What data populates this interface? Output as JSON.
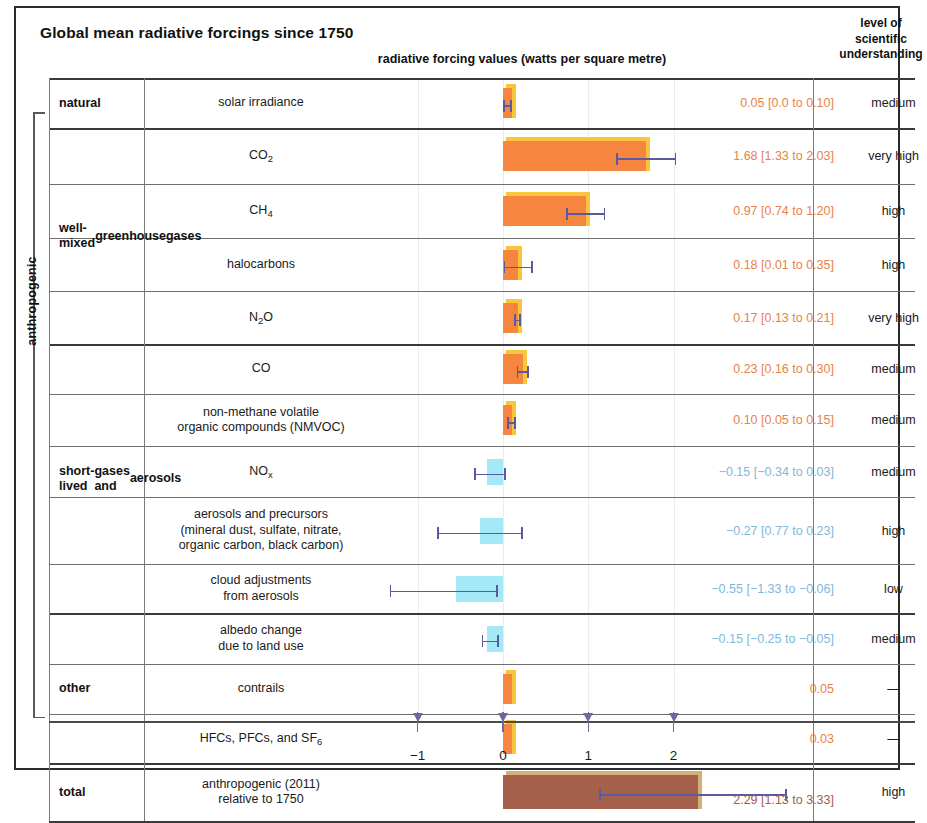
{
  "header": {
    "title": "Global mean radiative forcings since 1750",
    "chart_axis_title": "radiative forcing values (watts per square metre)",
    "lsu_col_line1": "level of",
    "lsu_col_line2": "scientific",
    "lsu_col_line3": "understanding"
  },
  "side_bracket": {
    "label": "anthropogenic"
  },
  "groups": [
    {
      "label": "natural"
    },
    {
      "label": "well-mixed\ngreenhouse\ngases"
    },
    {
      "label": "short-lived\ngases and\naerosols"
    },
    {
      "label": "other"
    },
    {
      "label": "total"
    }
  ],
  "colors": {
    "positive_bar": "#f5853f",
    "positive_bar_top": "#f9c53c",
    "negative_bar": "#a5e9f7",
    "total_bar": "#a4604a",
    "total_bar_top": "#d2b077",
    "error_bar": "#5a5aa0",
    "positive_text": "#e8824a",
    "negative_text": "#80b9da",
    "total_text": "#a4604a",
    "grid": "#ececec",
    "rule": "#6f6f6f"
  },
  "chart_data": {
    "type": "bar",
    "title": "Global mean radiative forcings since 1750",
    "xlabel": "radiative forcing values (watts per square metre)",
    "ylabel": "",
    "xlim": [
      -1.55,
      2.85
    ],
    "xticks": [
      -1,
      0,
      1,
      2
    ],
    "xticklabels": [
      "−1",
      "0",
      "1",
      "2"
    ],
    "grid": true,
    "orientation": "horizontal",
    "rows": [
      {
        "group": "natural",
        "label": "solar irradiance",
        "label_html": "solar irradiance",
        "value": 0.05,
        "low": 0.0,
        "high": 0.1,
        "value_text": "0.05 [0.0 to 0.10]",
        "lsu": "medium",
        "sign": "positive"
      },
      {
        "group": "well-mixed greenhouse gases",
        "label": "CO2",
        "label_html": "CO<sub>2</sub>",
        "value": 1.68,
        "low": 1.33,
        "high": 2.03,
        "value_text": "1.68 [1.33 to 2.03]",
        "lsu": "very high",
        "sign": "positive"
      },
      {
        "group": "well-mixed greenhouse gases",
        "label": "CH4",
        "label_html": "CH<sub>4</sub>",
        "value": 0.97,
        "low": 0.74,
        "high": 1.2,
        "value_text": "0.97 [0.74 to 1.20]",
        "lsu": "high",
        "sign": "positive"
      },
      {
        "group": "well-mixed greenhouse gases",
        "label": "halocarbons",
        "label_html": "halocarbons",
        "value": 0.18,
        "low": 0.01,
        "high": 0.35,
        "value_text": "0.18 [0.01 to 0.35]",
        "lsu": "high",
        "sign": "positive"
      },
      {
        "group": "well-mixed greenhouse gases",
        "label": "N2O",
        "label_html": "N<sub>2</sub>O",
        "value": 0.17,
        "low": 0.13,
        "high": 0.21,
        "value_text": "0.17 [0.13 to 0.21]",
        "lsu": "very high",
        "sign": "positive"
      },
      {
        "group": "short-lived gases and aerosols",
        "label": "CO",
        "label_html": "CO",
        "value": 0.23,
        "low": 0.16,
        "high": 0.3,
        "value_text": "0.23 [0.16 to 0.30]",
        "lsu": "medium",
        "sign": "positive"
      },
      {
        "group": "short-lived gases and aerosols",
        "label": "non-methane volatile organic compounds (NMVOC)",
        "label_html": "non-methane volatile<br>organic compounds (NMVOC)",
        "value": 0.1,
        "low": 0.05,
        "high": 0.15,
        "value_text": "0.10 [0.05 to 0.15]",
        "lsu": "medium",
        "sign": "positive"
      },
      {
        "group": "short-lived gases and aerosols",
        "label": "NOx",
        "label_html": "NO<sub>x</sub>",
        "value": -0.15,
        "low": -0.34,
        "high": 0.03,
        "value_text": "−0.15 [−0.34 to 0.03]",
        "lsu": "medium",
        "sign": "negative"
      },
      {
        "group": "short-lived gases and aerosols",
        "label": "aerosols and precursors (mineral dust, sulfate, nitrate, organic carbon, black carbon)",
        "label_html": "aerosols and precursors<br>(mineral dust, sulfate, nitrate,<br>organic carbon, black carbon)",
        "value": -0.27,
        "low": -0.77,
        "high": 0.23,
        "value_text": "−0.27 [0.77 to 0.23]",
        "lsu": "high",
        "sign": "negative"
      },
      {
        "group": "short-lived gases and aerosols",
        "label": "cloud adjustments from aerosols",
        "label_html": "cloud adjustments<br>from aerosols",
        "value": -0.55,
        "low": -1.33,
        "high": -0.06,
        "value_text": "−0.55 [−1.33 to −0.06]",
        "lsu": "low",
        "sign": "negative"
      },
      {
        "group": "other",
        "label": "albedo change due to land use",
        "label_html": "albedo change<br>due to land use",
        "value": -0.15,
        "low": -0.25,
        "high": -0.05,
        "value_text": "−0.15 [−0.25 to −0.05]",
        "lsu": "medium",
        "sign": "negative"
      },
      {
        "group": "other",
        "label": "contrails",
        "label_html": "contrails",
        "value": 0.05,
        "low": null,
        "high": null,
        "value_text": "0.05",
        "lsu": "—",
        "sign": "positive"
      },
      {
        "group": "other",
        "label": "HFCs, PFCs, and SF6",
        "label_html": "HFCs, PFCs, and SF<sub>6</sub>",
        "value": 0.03,
        "low": null,
        "high": null,
        "value_text": "0.03",
        "lsu": "—",
        "sign": "positive"
      },
      {
        "group": "total",
        "label": "anthropogenic (2011) relative to 1750",
        "label_html": "anthropogenic (2011)<br>relative to 1750",
        "value": 2.29,
        "low": 1.13,
        "high": 3.33,
        "value_text": "2.29 [1.13 to 3.33]",
        "lsu": "high",
        "sign": "total"
      }
    ]
  }
}
